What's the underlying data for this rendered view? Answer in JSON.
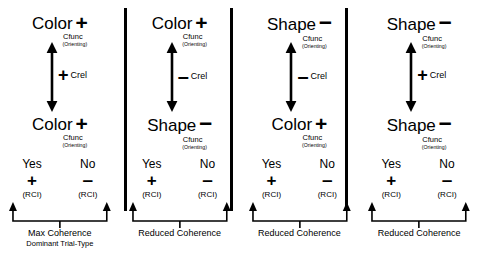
{
  "diagram": {
    "colors": {
      "ink": "#000000",
      "background": "#ffffff"
    },
    "labels": {
      "subscript_func": "Cfunc",
      "subscript_orienting": "(Orienting)",
      "crel_text": "Crel",
      "response_yes": "Yes",
      "response_no": "No",
      "response_yes_sign": "+",
      "response_no_sign": "–",
      "response_sub": "(RCI)"
    },
    "panels": [
      {
        "id": "panel-1",
        "top_node": {
          "word": "Color",
          "sign": "+",
          "sub1": "Cfunc",
          "sub2": "(Orienting)"
        },
        "bottom_node": {
          "word": "Color",
          "sign": "+",
          "sub1": "Cfunc",
          "sub2": "(Orienting)"
        },
        "crel_sign": "+",
        "crel_label": "Crel",
        "responses": [
          {
            "label": "Yes",
            "sign": "+",
            "sub": "(RCI)"
          },
          {
            "label": "No",
            "sign": "–",
            "sub": "(RCI)"
          }
        ],
        "caption_line1": "Max Coherence",
        "caption_line2": "Dominant Trial-Type"
      },
      {
        "id": "panel-2",
        "top_node": {
          "word": "Color",
          "sign": "+",
          "sub1": "Cfunc",
          "sub2": "(Orienting)"
        },
        "bottom_node": {
          "word": "Shape",
          "sign": "–",
          "sub1": "Cfunc",
          "sub2": "(Orienting)"
        },
        "crel_sign": "–",
        "crel_label": "Crel",
        "responses": [
          {
            "label": "Yes",
            "sign": "+",
            "sub": "(RCI)"
          },
          {
            "label": "No",
            "sign": "–",
            "sub": "(RCI)"
          }
        ],
        "caption_line1": "Reduced Coherence",
        "caption_line2": ""
      },
      {
        "id": "panel-3",
        "top_node": {
          "word": "Shape",
          "sign": "–",
          "sub1": "Cfunc",
          "sub2": "(Orienting)"
        },
        "bottom_node": {
          "word": "Color",
          "sign": "+",
          "sub1": "Cfunc",
          "sub2": "(Orienting)"
        },
        "crel_sign": "–",
        "crel_label": "Crel",
        "responses": [
          {
            "label": "Yes",
            "sign": "+",
            "sub": "(RCI)"
          },
          {
            "label": "No",
            "sign": "–",
            "sub": "(RCI)"
          }
        ],
        "caption_line1": "Reduced Coherence",
        "caption_line2": ""
      },
      {
        "id": "panel-4",
        "top_node": {
          "word": "Shape",
          "sign": "–",
          "sub1": "Cfunc",
          "sub2": "(Orienting)"
        },
        "bottom_node": {
          "word": "Shape",
          "sign": "–",
          "sub1": "Cfunc",
          "sub2": "(Orienting)"
        },
        "crel_sign": "+",
        "crel_label": "Crel",
        "responses": [
          {
            "label": "Yes",
            "sign": "+",
            "sub": "(RCI)"
          },
          {
            "label": "No",
            "sign": "–",
            "sub": "(RCI)"
          }
        ],
        "caption_line1": "Reduced Coherence",
        "caption_line2": ""
      }
    ]
  }
}
